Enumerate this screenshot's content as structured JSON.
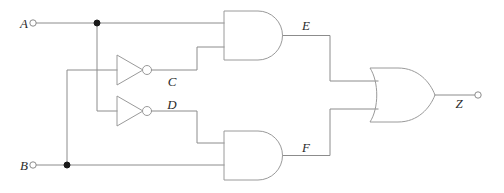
{
  "diagram": {
    "type": "logic-gate-schematic",
    "colors": {
      "wire": "#8c8c8c",
      "gate_outline": "#9a9a9a",
      "junction": "#1a1a1a",
      "label": "#2b2b2b",
      "background": "#ffffff"
    },
    "inputs": [
      {
        "id": "A",
        "label": "A",
        "x": 33,
        "y": 23
      },
      {
        "id": "B",
        "label": "B",
        "x": 33,
        "y": 165
      }
    ],
    "outputs": [
      {
        "id": "Z",
        "label": "Z",
        "x": 478,
        "y": 95
      }
    ],
    "internal_signals": [
      {
        "id": "C",
        "label": "C",
        "x": 172,
        "y": 82
      },
      {
        "id": "D",
        "label": "D",
        "x": 172,
        "y": 105
      },
      {
        "id": "E",
        "label": "E",
        "x": 306,
        "y": 26
      },
      {
        "id": "F",
        "label": "F",
        "x": 306,
        "y": 148
      }
    ],
    "gates": [
      {
        "id": "inv1",
        "type": "NOT",
        "label": "inverter-c",
        "output_signal": "C"
      },
      {
        "id": "inv2",
        "type": "NOT",
        "label": "inverter-d",
        "output_signal": "D"
      },
      {
        "id": "and1",
        "type": "AND",
        "label": "and-gate-e",
        "output_signal": "E"
      },
      {
        "id": "and2",
        "type": "AND",
        "label": "and-gate-f",
        "output_signal": "F"
      },
      {
        "id": "or1",
        "type": "OR",
        "label": "or-gate-z",
        "output_signal": "Z"
      }
    ],
    "junctions": [
      {
        "id": "j-a",
        "x": 97,
        "y": 23
      },
      {
        "id": "j-b",
        "x": 67,
        "y": 165
      }
    ]
  }
}
